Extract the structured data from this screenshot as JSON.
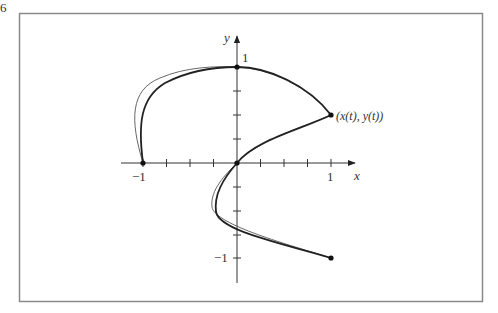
{
  "figure": {
    "corner_label": "6",
    "axes": {
      "x_label": "x",
      "y_label": "y",
      "x_ticks": [
        "−1",
        "1"
      ],
      "y_ticks": [
        "1",
        "−1"
      ],
      "subdivisions_per_unit": 4
    },
    "point_label": "(x(t), y(t))",
    "marked_points": [
      {
        "x": -1,
        "y": 0
      },
      {
        "x": 0,
        "y": 1
      },
      {
        "x": 1,
        "y": 0.5
      },
      {
        "x": 0,
        "y": 0
      },
      {
        "x": 1,
        "y": -1
      }
    ],
    "curves": [
      {
        "name": "parametric-curve",
        "stroke": "#222222",
        "width": 1.8
      },
      {
        "name": "approximation-curve",
        "stroke": "#555555",
        "width": 0.9
      }
    ],
    "frame_color": "#8a8a8a"
  }
}
